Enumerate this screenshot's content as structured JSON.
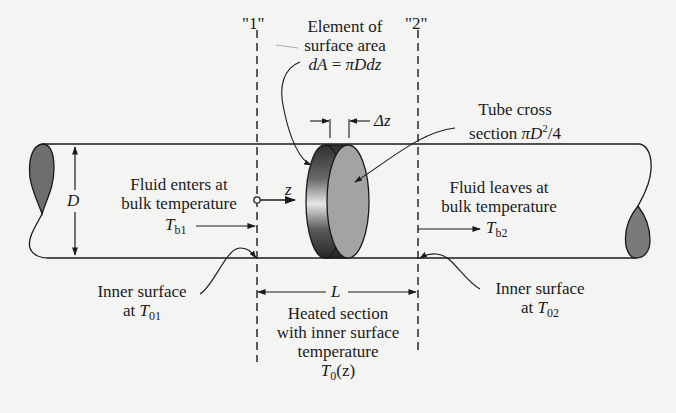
{
  "figure": {
    "section_markers": {
      "station_1": "\"1\"",
      "station_2": "\"2\""
    },
    "element_label": {
      "line1": "Element of",
      "line2": "surface area",
      "formula_lhs": "dA",
      "formula_eq": " = ",
      "formula_rhs": "πDdz"
    },
    "delta_label": "Δz",
    "tube_cross_section": {
      "line1": "Tube cross",
      "line2_prefix": "section ",
      "formula_pi": "π",
      "formula_D": "D",
      "formula_exp": "2",
      "formula_tail": "/4"
    },
    "diameter_label": "D",
    "axis_label": "z",
    "inlet": {
      "line1": "Fluid enters at",
      "line2": "bulk temperature",
      "symbol": "T",
      "subscript": "b1"
    },
    "outlet": {
      "line1": "Fluid leaves at",
      "line2": "bulk temperature",
      "symbol": "T",
      "subscript": "b2"
    },
    "inner_surface_1": {
      "line1": "Inner surface",
      "line2_prefix": "at ",
      "symbol": "T",
      "subscript": "01"
    },
    "inner_surface_2": {
      "line1": "Inner surface",
      "line2_prefix": "at ",
      "symbol": "T",
      "subscript": "02"
    },
    "length_label": "L",
    "heated_section": {
      "line1": "Heated section",
      "line2": "with inner surface",
      "line3": "temperature",
      "symbol": "T",
      "subscript": "0",
      "arg": "(z)"
    },
    "colors": {
      "background": "#f4f4f2",
      "ink": "#1a1a1a",
      "end_cap_fill": "#6e6e6e",
      "disc_face_fill": "#a3a3a3",
      "disc_rim_dark": "#3a3a3a"
    }
  }
}
